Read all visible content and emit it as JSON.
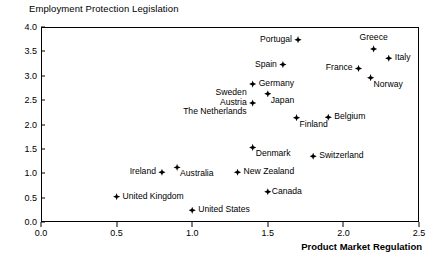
{
  "chart_data": {
    "type": "scatter",
    "title": "",
    "xlabel": "Product Market Regulation",
    "ylabel": "Employment Protection Legislation",
    "xlim": [
      0.0,
      2.5
    ],
    "ylim": [
      0.0,
      4.0
    ],
    "xticks": [
      "0.0",
      "0.5",
      "1.0",
      "1.5",
      "2.0",
      "2.5"
    ],
    "yticks": [
      "0.0",
      "0.5",
      "1.0",
      "1.5",
      "2.0",
      "2.5",
      "3.0",
      "3.5",
      "4.0"
    ],
    "grid": false,
    "legend": "none",
    "marker_color": "#000000",
    "points": [
      {
        "label": "Portugal",
        "x": 1.7,
        "y": 3.74,
        "anchor": "left"
      },
      {
        "label": "Greece",
        "x": 2.2,
        "y": 3.55,
        "anchor": "above"
      },
      {
        "label": "Italy",
        "x": 2.3,
        "y": 3.36,
        "anchor": "right"
      },
      {
        "label": "Spain",
        "x": 1.6,
        "y": 3.23,
        "anchor": "left"
      },
      {
        "label": "France",
        "x": 2.1,
        "y": 3.15,
        "anchor": "left"
      },
      {
        "label": "Norway",
        "x": 2.18,
        "y": 2.96,
        "anchor": "below-right"
      },
      {
        "label": "Germany",
        "x": 1.4,
        "y": 2.83,
        "anchor": "right"
      },
      {
        "label": "Japan",
        "x": 1.5,
        "y": 2.63,
        "anchor": "below-right"
      },
      {
        "label": "Sweden\nAustria\nThe Netherlands",
        "x": 1.4,
        "y": 2.44,
        "anchor": "left-stack"
      },
      {
        "label": "Belgium",
        "x": 1.9,
        "y": 2.15,
        "anchor": "right"
      },
      {
        "label": "Finland",
        "x": 1.69,
        "y": 2.14,
        "anchor": "below-right"
      },
      {
        "label": "Denmark",
        "x": 1.4,
        "y": 1.53,
        "anchor": "below-right"
      },
      {
        "label": "Switzerland",
        "x": 1.8,
        "y": 1.35,
        "anchor": "right"
      },
      {
        "label": "Australia",
        "x": 0.9,
        "y": 1.12,
        "anchor": "below-right"
      },
      {
        "label": "Ireland",
        "x": 0.8,
        "y": 1.02,
        "anchor": "left"
      },
      {
        "label": "New Zealand",
        "x": 1.3,
        "y": 1.02,
        "anchor": "right"
      },
      {
        "label": "Canada",
        "x": 1.5,
        "y": 0.62,
        "anchor": "right-tight"
      },
      {
        "label": "United Kingdom",
        "x": 0.5,
        "y": 0.52,
        "anchor": "right"
      },
      {
        "label": "United States",
        "x": 1.0,
        "y": 0.24,
        "anchor": "right"
      }
    ]
  }
}
